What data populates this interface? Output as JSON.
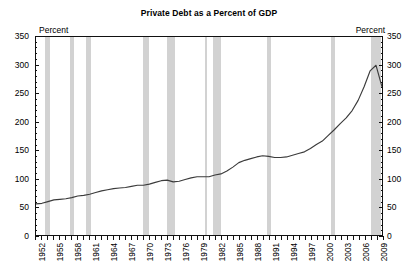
{
  "chart_data": {
    "type": "line",
    "title": "Private Debt as a Percent of GDP",
    "xlabel": "",
    "ylabel": "Percent",
    "y_unit_label_left": "Percent",
    "y_unit_label_right": "Percent",
    "xlim": [
      1952,
      2010
    ],
    "ylim": [
      0,
      350
    ],
    "y_ticks": [
      0,
      50,
      100,
      150,
      200,
      250,
      300,
      350
    ],
    "y_minor_tick_step": 10,
    "x_tick_labels": [
      "1952",
      "1955",
      "1958",
      "1961",
      "1964",
      "1967",
      "1970",
      "1973",
      "1976",
      "1979",
      "1982",
      "1985",
      "1988",
      "1991",
      "1994",
      "1997",
      "2000",
      "2003",
      "2006",
      "2009"
    ],
    "x_tick_step_years": 1,
    "grid": false,
    "legend": "none",
    "series": [
      {
        "name": "Private Debt as a Percent of GDP",
        "color": "#3b3b3b",
        "x": [
          1952,
          1953,
          1954,
          1955,
          1956,
          1957,
          1958,
          1959,
          1960,
          1961,
          1962,
          1963,
          1964,
          1965,
          1966,
          1967,
          1968,
          1969,
          1970,
          1971,
          1972,
          1973,
          1974,
          1975,
          1976,
          1977,
          1978,
          1979,
          1980,
          1981,
          1982,
          1983,
          1984,
          1985,
          1986,
          1987,
          1988,
          1989,
          1990,
          1991,
          1992,
          1993,
          1994,
          1995,
          1996,
          1997,
          1998,
          1999,
          2000,
          2001,
          2002,
          2003,
          2004,
          2005,
          2006,
          2007,
          2008,
          2009,
          2010
        ],
        "values": [
          55,
          56,
          59,
          62,
          63,
          64,
          66,
          69,
          70,
          72,
          75,
          78,
          80,
          82,
          83,
          84,
          86,
          88,
          88,
          90,
          93,
          96,
          97,
          94,
          95,
          98,
          101,
          103,
          103,
          103,
          106,
          108,
          113,
          120,
          128,
          132,
          135,
          138,
          140,
          139,
          137,
          137,
          138,
          141,
          144,
          147,
          153,
          160,
          166,
          176,
          186,
          197,
          207,
          220,
          238,
          262,
          290,
          300,
          262
        ]
      }
    ],
    "recession_bands": [
      {
        "label": "1953-1954",
        "start": 1953.5,
        "end": 1954.4
      },
      {
        "label": "1957-1958",
        "start": 1957.6,
        "end": 1958.3
      },
      {
        "label": "1960-1961",
        "start": 1960.3,
        "end": 1961.1
      },
      {
        "label": "1969-1970",
        "start": 1969.9,
        "end": 1970.9
      },
      {
        "label": "1973-1975",
        "start": 1973.9,
        "end": 1975.2
      },
      {
        "label": "1980",
        "start": 1980.1,
        "end": 1980.5
      },
      {
        "label": "1981-1982",
        "start": 1981.5,
        "end": 1982.9
      },
      {
        "label": "1990-1991",
        "start": 1990.5,
        "end": 1991.2
      },
      {
        "label": "2001",
        "start": 2001.2,
        "end": 2001.9
      },
      {
        "label": "2007-2009",
        "start": 2007.9,
        "end": 2009.5
      }
    ]
  }
}
